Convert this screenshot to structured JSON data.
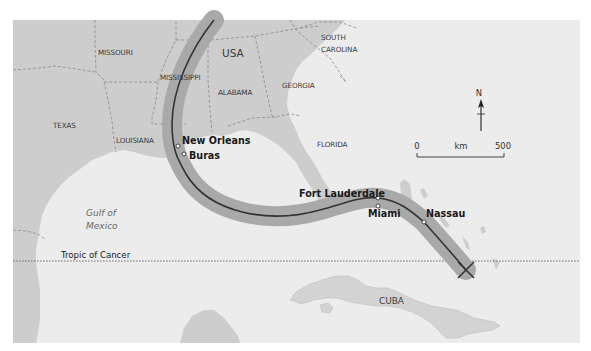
{
  "map": {
    "colors": {
      "sea": "#ececec",
      "land": "#cdcdcd",
      "cuba_land": "#d3d3d3",
      "track_band": "#a9a9a9",
      "track_line": "#333333",
      "border": "#888888"
    },
    "country_labels": {
      "usa": "USA",
      "cuba": "CUBA"
    },
    "state_labels": {
      "missouri": "MISSOURI",
      "mississippi": "MISSISSIPPI",
      "alabama": "ALABAMA",
      "georgia": "GEORGIA",
      "south_carolina_1": "SOUTH",
      "south_carolina_2": "CAROLINA",
      "texas": "TEXAS",
      "louisiana": "LOUISIANA",
      "florida": "FLORIDA"
    },
    "sea_labels": {
      "gulf_1": "Gulf of",
      "gulf_2": "Mexico"
    },
    "cities": [
      {
        "name": "New Orleans"
      },
      {
        "name": "Buras"
      },
      {
        "name": "Fort Lauderdale"
      },
      {
        "name": "Miami"
      },
      {
        "name": "Nassau"
      }
    ],
    "tropic_label": "Tropic of Cancer",
    "north_arrow": {
      "label": "N"
    },
    "scale_bar": {
      "start": "0",
      "unit": "km",
      "end": "500"
    }
  }
}
